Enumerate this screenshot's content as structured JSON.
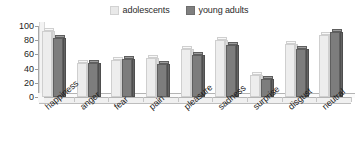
{
  "chart_data": {
    "type": "bar",
    "title": "",
    "subtitle": "",
    "xlabel": "",
    "ylabel": "",
    "ylim": [
      0,
      100
    ],
    "yticks": [
      0,
      20,
      40,
      60,
      80,
      100
    ],
    "grid": false,
    "legend_position": "top-center",
    "categories": [
      "happiness",
      "anger",
      "fear",
      "pain",
      "pleasure",
      "sadness",
      "surprise",
      "disgust",
      "neutral"
    ],
    "series": [
      {
        "name": "adolescents",
        "color": "#ededed",
        "values": [
          93,
          48,
          52,
          55,
          67,
          80,
          31,
          75,
          88
        ]
      },
      {
        "name": "young adults",
        "color": "#7d7d7d",
        "values": [
          83,
          48,
          54,
          46,
          59,
          73,
          26,
          68,
          92
        ]
      }
    ]
  },
  "legend": {
    "entries": [
      {
        "label": "adolescents",
        "swatch": "light-gray-swatch-icon"
      },
      {
        "label": "young adults",
        "swatch": "dark-gray-swatch-icon"
      }
    ]
  },
  "axis": {
    "y_tick_labels": [
      "100",
      "80",
      "60",
      "40",
      "20",
      "0"
    ]
  },
  "colors": {
    "series_light": "#ededed",
    "series_dark": "#7d7d7d",
    "axis": "#a8a8a8",
    "text": "#1a1a1a",
    "background": "#ffffff"
  }
}
